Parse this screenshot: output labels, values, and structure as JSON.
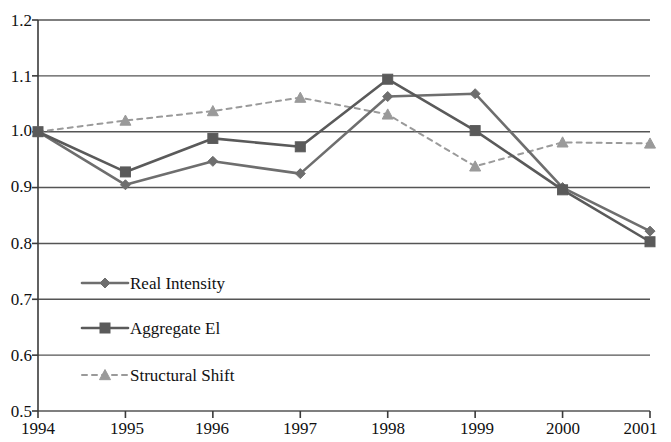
{
  "chart_data": {
    "type": "line",
    "title": "",
    "subtitle": "",
    "xlabel": "",
    "ylabel": "",
    "categories": [
      "1994",
      "1995",
      "1996",
      "1997",
      "1998",
      "1999",
      "2000",
      "2001"
    ],
    "x": [
      1994,
      1995,
      1996,
      1997,
      1998,
      1999,
      2000,
      2001
    ],
    "xlim": [
      1994,
      2001
    ],
    "ylim": [
      0.5,
      1.2
    ],
    "ytick_labels": [
      "1.2",
      "1.1",
      "1.0",
      "0.9",
      "0.8",
      "0.7",
      "0.6",
      "0.5"
    ],
    "ytick_values": [
      1.2,
      1.1,
      1.0,
      0.9,
      0.8,
      0.7,
      0.6,
      0.5
    ],
    "grid": "horizontal",
    "legend_position": "inside-lower-left",
    "series": [
      {
        "name": "Real Intensity",
        "marker": "diamond",
        "line_style": "solid",
        "color": "#6e6e6e",
        "values": [
          1.0,
          0.905,
          0.947,
          0.925,
          1.063,
          1.068,
          0.9,
          0.822
        ]
      },
      {
        "name": "Aggregate El",
        "marker": "square",
        "line_style": "solid",
        "color": "#5a5a5a",
        "values": [
          1.0,
          0.928,
          0.988,
          0.973,
          1.094,
          1.002,
          0.896,
          0.803
        ]
      },
      {
        "name": "Structural Shift",
        "marker": "triangle",
        "line_style": "dashed",
        "color": "#9a9a9a",
        "values": [
          1.0,
          1.02,
          1.037,
          1.061,
          1.031,
          0.938,
          0.981,
          0.979
        ]
      }
    ]
  },
  "legend": {
    "items": [
      {
        "label": "Real Intensity",
        "marker": "diamond-marker-icon"
      },
      {
        "label": "Aggregate El",
        "marker": "square-marker-icon"
      },
      {
        "label": "Structural Shift",
        "marker": "triangle-marker-icon"
      }
    ]
  },
  "axes": {
    "y_labels": [
      "1.2",
      "1.1",
      "1.0",
      "0.9",
      "0.8",
      "0.7",
      "0.6",
      "0.5"
    ],
    "x_labels": [
      "1994",
      "1995",
      "1996",
      "1997",
      "1998",
      "1999",
      "2000",
      "2001"
    ]
  },
  "colors": {
    "axis": "#3a3a3a",
    "grid": "#555555",
    "series_real_intensity": "#6e6e6e",
    "series_aggregate_ei": "#5a5a5a",
    "series_structural_shift": "#9a9a9a",
    "text": "#111111",
    "background": "#ffffff"
  }
}
